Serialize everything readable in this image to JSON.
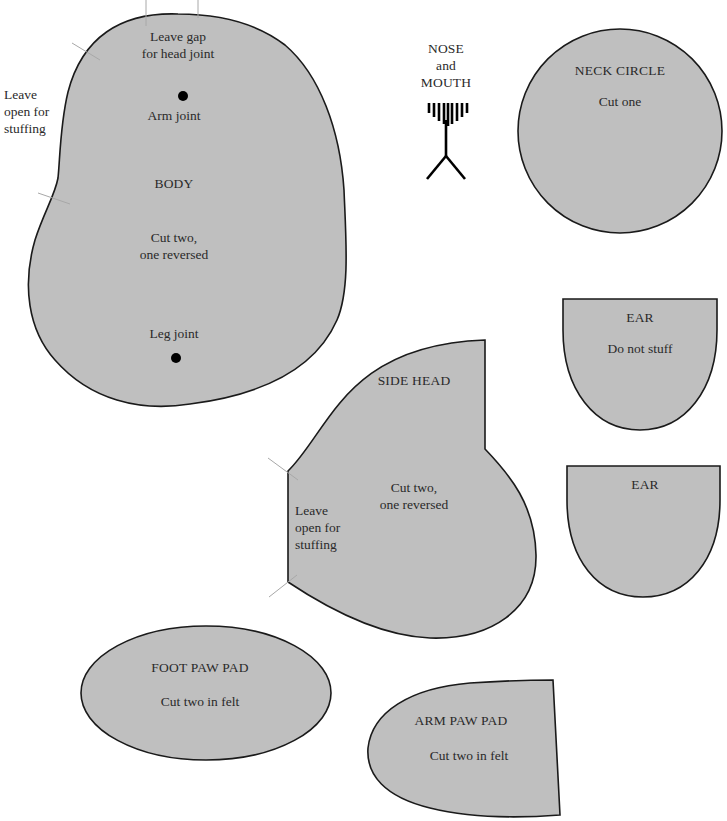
{
  "colors": {
    "piece_fill": "#bfbfbf",
    "outline": "#1a1a1a",
    "guide_marks": "#a8a8a8",
    "text": "#2a2a2a",
    "background": "#ffffff"
  },
  "pieces": {
    "body": {
      "title": "BODY",
      "instruction": "Cut two,\none reversed",
      "head_gap_note": "Leave gap\nfor head joint",
      "stuffing_note": "Leave\nopen for\nstuffing",
      "arm_joint_label": "Arm joint",
      "leg_joint_label": "Leg joint"
    },
    "nose_mouth": {
      "title": "NOSE\nand\nMOUTH",
      "nose_stitch_count": 9
    },
    "neck_circle": {
      "title": "NECK CIRCLE",
      "instruction": "Cut one"
    },
    "ear_1": {
      "title": "EAR",
      "instruction": "Do not stuff"
    },
    "ear_2": {
      "title": "EAR"
    },
    "side_head": {
      "title": "SIDE HEAD",
      "instruction": "Cut two,\none reversed",
      "stuffing_note": "Leave\nopen for\nstuffing"
    },
    "foot_paw_pad": {
      "title": "FOOT PAW PAD",
      "instruction": "Cut two in felt"
    },
    "arm_paw_pad": {
      "title": "ARM PAW PAD",
      "instruction": "Cut two in felt"
    }
  }
}
